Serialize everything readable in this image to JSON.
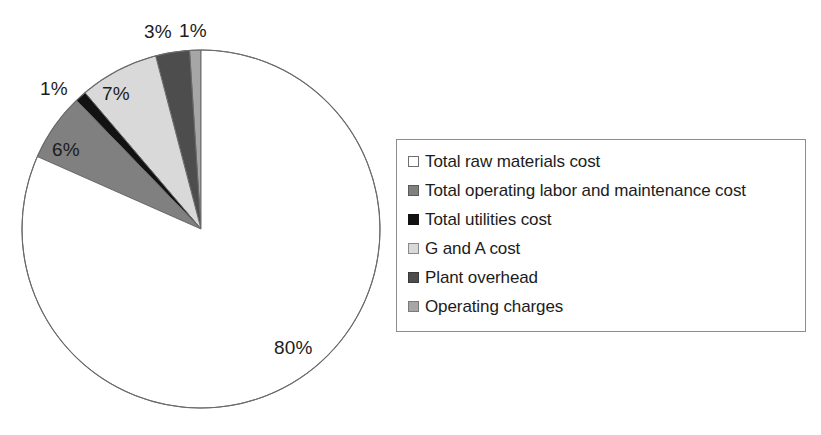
{
  "chart_data": {
    "type": "pie",
    "title": "",
    "subtitle": "",
    "xlabel": "",
    "ylabel": "",
    "grid": false,
    "legend_position": "right",
    "start_angle_deg": 0,
    "direction": "counterclockwise",
    "units": "percent",
    "categories": [
      "Total raw materials cost",
      "Total operating labor and maintenance cost",
      "Total utilities cost",
      "G and A cost",
      "Plant overhead",
      "Operating charges"
    ],
    "values": [
      80,
      6,
      1,
      7,
      3,
      1
    ],
    "value_labels": [
      "80%",
      "6%",
      "1%",
      "7%",
      "3%",
      "1%"
    ],
    "colors": [
      "#ffffff",
      "#808080",
      "#121212",
      "#d9d9d9",
      "#4d4d4d",
      "#a6a6a6"
    ],
    "slice_order_counterclockwise_from_top": [
      "Operating charges",
      "Plant overhead",
      "G and A cost",
      "Total utilities cost",
      "Total operating labor and maintenance cost",
      "Total raw materials cost"
    ],
    "geometry": {
      "center_x": 201,
      "center_y": 229,
      "radius": 179,
      "outline_color": "#6b6b6b"
    },
    "labels": [
      {
        "text": "3%",
        "x": 144,
        "y": 22,
        "slice": "Plant overhead"
      },
      {
        "text": "1%",
        "x": 179,
        "y": 21,
        "slice": "Operating charges"
      },
      {
        "text": "1%",
        "x": 40,
        "y": 79,
        "slice": "Total utilities cost"
      },
      {
        "text": "7%",
        "x": 102,
        "y": 84,
        "slice": "G and A cost"
      },
      {
        "text": "6%",
        "x": 52,
        "y": 140,
        "slice": "Total operating labor and maintenance cost"
      },
      {
        "text": "80%",
        "x": 274,
        "y": 338,
        "slice": "Total raw materials cost"
      }
    ]
  },
  "legend": {
    "items": [
      {
        "label": "Total raw materials cost",
        "color": "#ffffff",
        "border": "#6e6e6e"
      },
      {
        "label": "Total operating labor and maintenance cost",
        "color": "#808080",
        "border": "#5a5a5a"
      },
      {
        "label": "Total utilities cost",
        "color": "#121212",
        "border": "#121212"
      },
      {
        "label": "G and A cost",
        "color": "#d9d9d9",
        "border": "#8a8a8a"
      },
      {
        "label": "Plant overhead",
        "color": "#4d4d4d",
        "border": "#3a3a3a"
      },
      {
        "label": "Operating charges",
        "color": "#a6a6a6",
        "border": "#7a7a7a"
      }
    ]
  }
}
